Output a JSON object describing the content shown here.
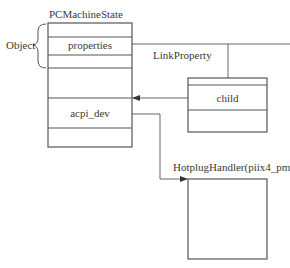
{
  "diagram": {
    "main_struct": {
      "title": "PCMachineState",
      "group_label": "Object",
      "rows": [
        "",
        "properties",
        "",
        "",
        "acpi_dev",
        ""
      ]
    },
    "link": {
      "label": "LinkProperty"
    },
    "child_struct": {
      "rows": [
        "",
        "child",
        ""
      ]
    },
    "handler_struct": {
      "title": "HotplugHandler(piix4_pm)"
    },
    "colors": {
      "line": "#555555",
      "background": "#ffffff",
      "text": "#3a3a3a"
    }
  }
}
